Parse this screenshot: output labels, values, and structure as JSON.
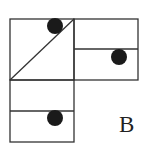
{
  "figure": {
    "label": "B",
    "stroke_color": "#333333",
    "dot_color": "#1a1a1a",
    "panels": [
      {
        "name": "top-left-square",
        "divider": "diagonal",
        "dot": "top-right corner"
      },
      {
        "name": "top-right-square",
        "divider": "horizontal",
        "dot": "lower half, right"
      },
      {
        "name": "bottom-left-square",
        "divider": "horizontal",
        "dot": "lower half, right"
      }
    ]
  }
}
